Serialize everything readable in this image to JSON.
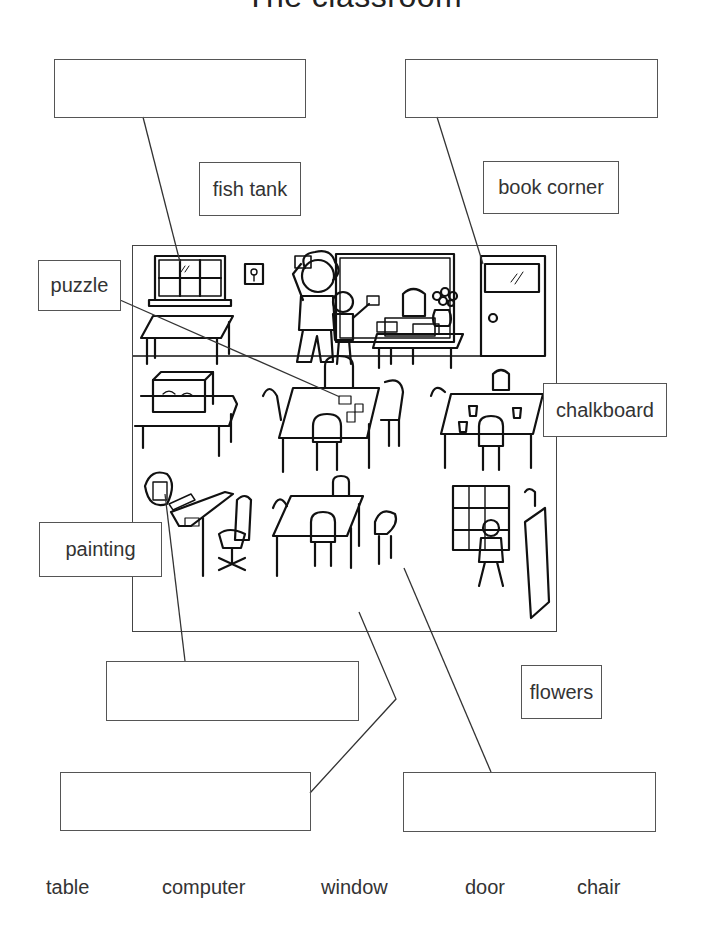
{
  "worksheet": {
    "title": "The classroom",
    "picture_description": "Line drawing of a classroom with window, door, chalkboard, tables, chairs, computer, fish tank, puzzle, flowers, painting and book corner",
    "answer_boxes": [
      {
        "id": "answer-1",
        "value": ""
      },
      {
        "id": "answer-2",
        "value": ""
      },
      {
        "id": "answer-3",
        "value": ""
      },
      {
        "id": "answer-4",
        "value": ""
      },
      {
        "id": "answer-5",
        "value": ""
      }
    ],
    "labels": {
      "fish_tank": "fish tank",
      "book_corner": "book corner",
      "puzzle": "puzzle",
      "chalkboard": "chalkboard",
      "painting": "painting",
      "flowers": "flowers"
    },
    "word_bank": [
      "table",
      "computer",
      "window",
      "door",
      "chair"
    ]
  }
}
